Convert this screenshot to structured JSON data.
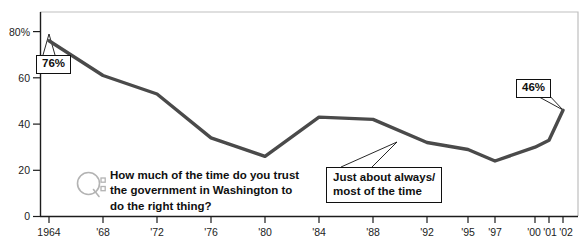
{
  "chart_data": {
    "type": "line",
    "title": "",
    "subtitle": "",
    "xlabel": "",
    "ylabel": "",
    "ylim": [
      0,
      85
    ],
    "ytick_values": [
      0,
      20,
      40,
      60,
      80
    ],
    "ytick_labels": [
      "0",
      "20",
      "40",
      "60",
      "80%"
    ],
    "grid": false,
    "legend_position": "none",
    "categories": [
      "1964",
      "'68",
      "'72",
      "'76",
      "'80",
      "'84",
      "'88",
      "'92",
      "'95",
      "'97",
      "'00",
      "'01",
      "'02"
    ],
    "x": [
      1964,
      1968,
      1972,
      1976,
      1980,
      1984,
      1988,
      1992,
      1995,
      1997,
      2000,
      2001,
      2002
    ],
    "series": [
      {
        "name": "Just about always/most of the time",
        "values": [
          76,
          61,
          53,
          34,
          26,
          43,
          42,
          32,
          29,
          24,
          30,
          33,
          46
        ]
      }
    ],
    "annotations": [
      {
        "name": "first-point-value",
        "label": "76%",
        "x": 1964,
        "y": 76
      },
      {
        "name": "last-point-value",
        "label": "46%",
        "x": 2002,
        "y": 46
      },
      {
        "name": "series-label",
        "label": "Just about always/\nmost of the time",
        "x": 1997,
        "y": 24
      }
    ],
    "colors": {
      "line": "#4a4a4a",
      "axis": "#1c1c1c",
      "plot_border": "#b9b9b9",
      "callout_border": "#101010",
      "text": "#101010",
      "q_icon": "#b3b3b3"
    }
  },
  "callouts": {
    "first_value": "76%",
    "last_value": "46%",
    "series_line1": "Just about always/",
    "series_line2": "most of the time"
  },
  "question": {
    "icon_name": "question-q-icon",
    "text": "How much of the time do you trust\nthe government in Washington to\ndo the right thing?"
  }
}
